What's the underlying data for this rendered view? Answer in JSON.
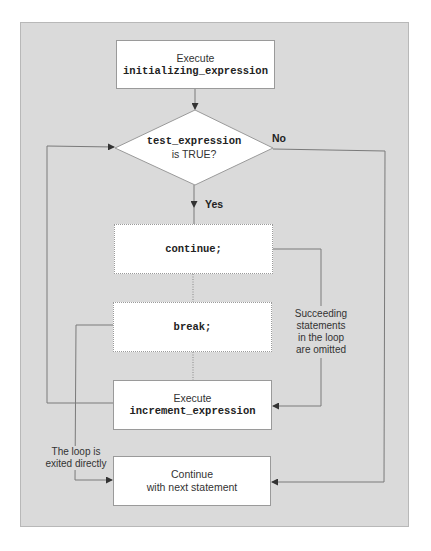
{
  "diagram": {
    "type": "flowchart",
    "colors": {
      "panel_background": "#dadada",
      "node_fill": "#ffffff",
      "line": "#7a7a7a",
      "text": "#333333"
    },
    "nodes": {
      "init": {
        "line1": "Execute",
        "line2": "initializing_expression"
      },
      "test": {
        "line1": "test_expression",
        "line2": "is TRUE?"
      },
      "continue_stmt": {
        "text": "continue;"
      },
      "break_stmt": {
        "text": "break;"
      },
      "increment": {
        "line1": "Execute",
        "line2": "increment_expression"
      },
      "next": {
        "line1": "Continue",
        "line2": "with next statement"
      }
    },
    "edge_labels": {
      "no": "No",
      "yes": "Yes",
      "omitted": [
        "Succeeding",
        "statements",
        "in the loop",
        "are omitted"
      ],
      "exited": [
        "The loop is",
        "exited directly"
      ]
    },
    "edges": [
      {
        "from": "init",
        "to": "test"
      },
      {
        "from": "test",
        "to": "continue_stmt",
        "label": "Yes"
      },
      {
        "from": "test",
        "to": "next",
        "label": "No"
      },
      {
        "from": "continue_stmt",
        "to": "break_stmt",
        "style": "dotted"
      },
      {
        "from": "break_stmt",
        "to": "increment",
        "style": "dotted"
      },
      {
        "from": "continue_stmt",
        "to": "increment",
        "label": "Succeeding statements in the loop are omitted"
      },
      {
        "from": "break_stmt",
        "to": "next",
        "label": "The loop is exited directly"
      },
      {
        "from": "increment",
        "to": "test"
      }
    ]
  }
}
